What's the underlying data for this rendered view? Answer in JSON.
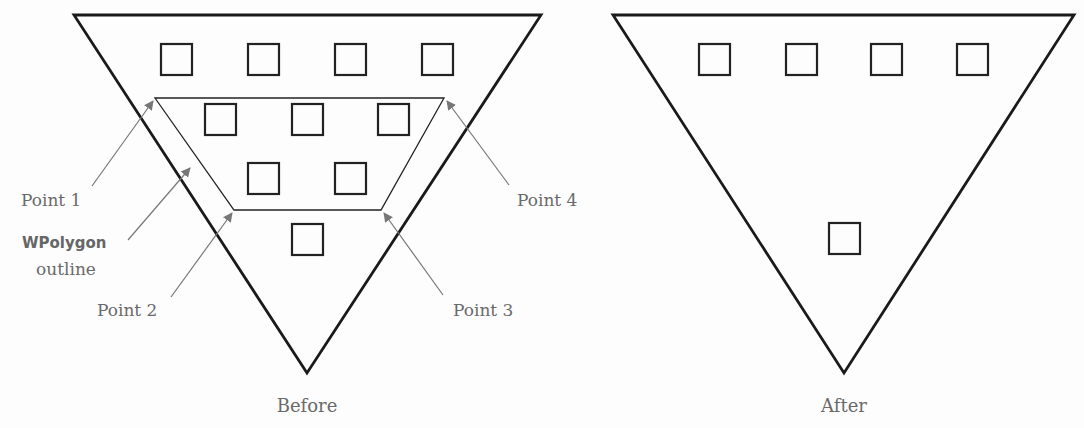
{
  "diagram": {
    "before": {
      "caption": "Before",
      "triangle": {
        "points": [
          [
            74,
            15
          ],
          [
            541,
            15
          ],
          [
            307,
            373
          ]
        ]
      },
      "polygon_outline": {
        "points": [
          [
            155,
            98
          ],
          [
            444,
            98
          ],
          [
            381,
            210
          ],
          [
            234,
            210
          ]
        ]
      },
      "squares": [
        {
          "x": 161,
          "y": 44,
          "size": 31
        },
        {
          "x": 248,
          "y": 44,
          "size": 31
        },
        {
          "x": 335,
          "y": 44,
          "size": 31
        },
        {
          "x": 422,
          "y": 44,
          "size": 31
        },
        {
          "x": 205,
          "y": 104,
          "size": 31
        },
        {
          "x": 292,
          "y": 104,
          "size": 31
        },
        {
          "x": 378,
          "y": 104,
          "size": 31
        },
        {
          "x": 248,
          "y": 163,
          "size": 31
        },
        {
          "x": 335,
          "y": 163,
          "size": 31
        },
        {
          "x": 292,
          "y": 224,
          "size": 31
        }
      ],
      "labels": {
        "point1": "Point 1",
        "point2": "Point 2",
        "point3": "Point 3",
        "point4": "Point 4",
        "outline_name": "WPolygon",
        "outline_word": "outline"
      }
    },
    "after": {
      "caption": "After",
      "triangle": {
        "points": [
          [
            613,
            15
          ],
          [
            1074,
            15
          ],
          [
            844,
            373
          ]
        ]
      },
      "squares": [
        {
          "x": 699,
          "y": 44,
          "size": 31
        },
        {
          "x": 786,
          "y": 44,
          "size": 31
        },
        {
          "x": 871,
          "y": 44,
          "size": 31
        },
        {
          "x": 957,
          "y": 44,
          "size": 31
        },
        {
          "x": 829,
          "y": 223,
          "size": 31
        }
      ]
    },
    "colors": {
      "stroke": "#1a1a1a",
      "label": "#6a6a6a",
      "leader": "#777777"
    }
  }
}
